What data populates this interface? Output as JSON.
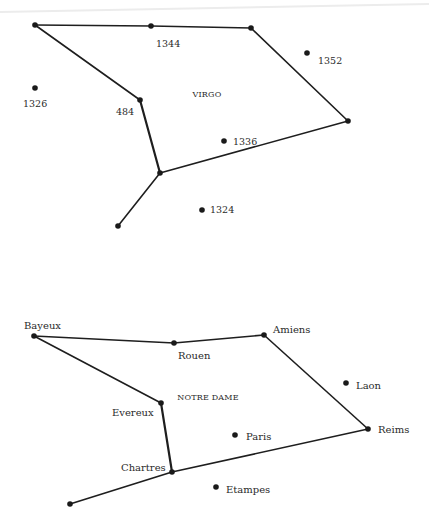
{
  "diagrams": [
    {
      "id": "virgo",
      "title": {
        "text": "VIRGO",
        "x": 207,
        "y": 95
      },
      "stars": [
        {
          "id": "v_a",
          "label": "",
          "x": 35,
          "y": 25
        },
        {
          "id": "v_1344",
          "label": "1344",
          "x": 151,
          "y": 26,
          "lx": 156,
          "ly": 44
        },
        {
          "id": "v_b",
          "label": "",
          "x": 251,
          "y": 28
        },
        {
          "id": "v_c",
          "label": "",
          "x": 348,
          "y": 121
        },
        {
          "id": "v_484",
          "label": "484",
          "x": 140,
          "y": 100,
          "lx": 116,
          "ly": 112
        },
        {
          "id": "v_j",
          "label": "",
          "x": 160,
          "y": 173
        },
        {
          "id": "v_tail",
          "label": "",
          "x": 118,
          "y": 226
        },
        {
          "id": "v_1326",
          "label": "1326",
          "x": 35,
          "y": 88,
          "lx": 23,
          "ly": 104
        },
        {
          "id": "v_1352",
          "label": "1352",
          "x": 307,
          "y": 53,
          "lx": 318,
          "ly": 61
        },
        {
          "id": "v_1336",
          "label": "1336",
          "x": 224,
          "y": 141,
          "lx": 233,
          "ly": 142
        },
        {
          "id": "v_1324",
          "label": "1324",
          "x": 202,
          "y": 210,
          "lx": 210,
          "ly": 210
        }
      ],
      "edges": [
        [
          "v_a",
          "v_1344"
        ],
        [
          "v_1344",
          "v_b"
        ],
        [
          "v_b",
          "v_c"
        ],
        [
          "v_c",
          "v_j"
        ],
        [
          "v_j",
          "v_484"
        ],
        [
          "v_484",
          "v_a"
        ],
        [
          "v_j",
          "v_tail"
        ]
      ]
    },
    {
      "id": "notre-dame",
      "title": {
        "text": "NOTRE DAME",
        "x": 208,
        "y": 398
      },
      "stars": [
        {
          "id": "n_bayeux",
          "label": "Bayeux",
          "x": 34,
          "y": 336,
          "lx": 24,
          "ly": 326
        },
        {
          "id": "n_rouen",
          "label": "Rouen",
          "x": 174,
          "y": 343,
          "lx": 178,
          "ly": 356
        },
        {
          "id": "n_amiens",
          "label": "Amiens",
          "x": 264,
          "y": 335,
          "lx": 273,
          "ly": 330
        },
        {
          "id": "n_reims",
          "label": "Reims",
          "x": 368,
          "y": 429,
          "lx": 378,
          "ly": 430
        },
        {
          "id": "n_evereux",
          "label": "Evereux",
          "x": 161,
          "y": 403,
          "lx": 112,
          "ly": 413
        },
        {
          "id": "n_chartres",
          "label": "Chartres",
          "x": 172,
          "y": 472,
          "lx": 121,
          "ly": 468
        },
        {
          "id": "n_tail",
          "label": "",
          "x": 70,
          "y": 504
        },
        {
          "id": "n_laon",
          "label": "Laon",
          "x": 346,
          "y": 383,
          "lx": 356,
          "ly": 386
        },
        {
          "id": "n_paris",
          "label": "Paris",
          "x": 235,
          "y": 435,
          "lx": 246,
          "ly": 437
        },
        {
          "id": "n_etampes",
          "label": "Etampes",
          "x": 216,
          "y": 487,
          "lx": 226,
          "ly": 490
        }
      ],
      "edges": [
        [
          "n_bayeux",
          "n_rouen"
        ],
        [
          "n_rouen",
          "n_amiens"
        ],
        [
          "n_amiens",
          "n_reims"
        ],
        [
          "n_reims",
          "n_chartres"
        ],
        [
          "n_chartres",
          "n_evereux"
        ],
        [
          "n_evereux",
          "n_bayeux"
        ],
        [
          "n_chartres",
          "n_tail"
        ]
      ]
    }
  ],
  "style": {
    "ink": "#1e1e1e",
    "background": "#ffffff"
  }
}
